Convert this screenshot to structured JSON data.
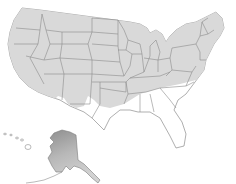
{
  "caption": {
    "text": "range map (cut off at top edge)"
  },
  "map": {
    "type": "range-map",
    "region": "United States",
    "insets": [
      "Alaska",
      "Hawaii"
    ],
    "colors": {
      "background": "#ffffff",
      "land": "#ffffff",
      "range_fill": "#d9d9d9",
      "state_border": "#8c8c8c",
      "alaska_dark": "#9a9a9a",
      "alaska_light": "#cfcfcf"
    },
    "shaded_region_description": "Northern and western contiguous US plus northeast; southern boundary runs through southern CA/AZ/NM, TX panhandle, OK, AR, TN, VA",
    "alaska_shading": "gradient, darker in north"
  }
}
